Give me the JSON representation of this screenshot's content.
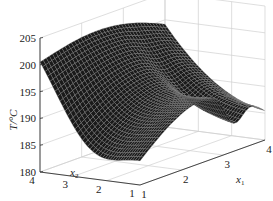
{
  "chart_data": {
    "type": "surface3d",
    "title": "",
    "zlabel": "T/°C",
    "xlabel": "x1",
    "ylabel": "x2",
    "x_axis": {
      "name": "x",
      "subscript": "1",
      "range": [
        1,
        4
      ],
      "ticks": [
        "1",
        "2",
        "3",
        "4"
      ]
    },
    "y_axis": {
      "name": "x",
      "subscript": "2",
      "range": [
        1,
        4
      ],
      "ticks": [
        "1",
        "2",
        "3",
        "4"
      ]
    },
    "z_axis": {
      "label": "T/°C",
      "range": [
        180,
        205
      ],
      "ticks": [
        "180",
        "185",
        "190",
        "195",
        "200",
        "205"
      ]
    },
    "grid": true,
    "surface_color": "#1a1a1a",
    "mesh_color": "#9a9a9a",
    "surface_samples": {
      "description": "approximate temperature T(x1,x2) read from surface; rows = x2 from 4 down to 1, cols = x1 from 1 to 4",
      "x1": [
        1,
        2,
        3,
        4
      ],
      "x2": [
        4,
        3,
        2,
        1
      ],
      "T": [
        [
          199,
          198,
          197,
          195
        ],
        [
          196,
          194,
          194,
          193
        ],
        [
          188,
          190,
          192,
          190
        ],
        [
          183,
          186,
          189,
          191
        ]
      ]
    }
  }
}
